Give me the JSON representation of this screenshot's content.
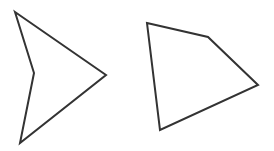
{
  "canvas": {
    "width": 274,
    "height": 151,
    "background": "#ffffff"
  },
  "style": {
    "stroke": "#333333",
    "stroke_width": 2,
    "fill": "none"
  },
  "shapes": [
    {
      "name": "concave-quadrilateral",
      "kind": "polygon",
      "vertices": [
        [
          15,
          12
        ],
        [
          106,
          75
        ],
        [
          20,
          143
        ],
        [
          34,
          73
        ]
      ]
    },
    {
      "name": "quadrilateral",
      "kind": "polygon",
      "vertices": [
        [
          147,
          23
        ],
        [
          208,
          37
        ],
        [
          258,
          85
        ],
        [
          160,
          130
        ]
      ]
    }
  ]
}
